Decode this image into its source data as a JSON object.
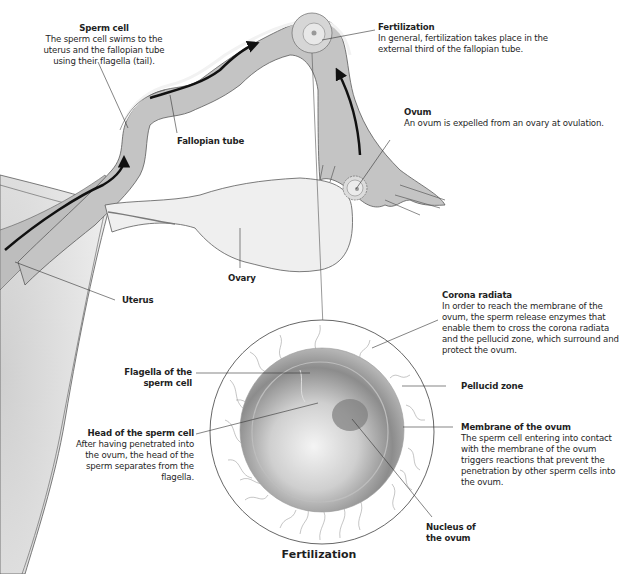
{
  "diagram": {
    "caption": "Fertilization",
    "labels": {
      "sperm_cell": {
        "title": "Sperm cell",
        "description": "The sperm cell swims to the uterus and the fallopian tube using their flagella (tail)."
      },
      "fertilization": {
        "title": "Fertilization",
        "description": "In general, fertilization takes place in the external third of the fallopian tube."
      },
      "ovum": {
        "title": "Ovum",
        "description": "An ovum is expelled from an ovary at ovulation."
      },
      "fallopian_tube": {
        "title": "Fallopian tube"
      },
      "ovary": {
        "title": "Ovary"
      },
      "uterus": {
        "title": "Uterus"
      },
      "corona_radiata": {
        "title": "Corona radiata",
        "description": "In order to reach the membrane of the ovum, the sperm release enzymes that enable them to cross the corona radiata and the pellucid zone, which surround and protect the ovum."
      },
      "pellucid_zone": {
        "title": "Pellucid zone"
      },
      "membrane_of_ovum": {
        "title": "Membrane of the ovum",
        "description": "The sperm cell entering into contact with the membrane of the ovum triggers reactions that prevent  the penetration by other sperm cells into the ovum."
      },
      "nucleus_of_ovum": {
        "title": "Nucleus of the ovum"
      },
      "flagella_of_sperm": {
        "title": "Flagella of the sperm cell"
      },
      "head_of_sperm": {
        "title": "Head of the sperm cell",
        "description": "After having penetrated into the ovum, the head of the sperm separates from the flagella."
      }
    },
    "colors": {
      "tube_fill": "#c4c4c4",
      "tube_wall": "#eeeeee",
      "outline": "#5a5a5a",
      "arrow": "#111111",
      "uterus_fill": "#d9d9d9",
      "ovary_fill": "#efefef",
      "ovum_dark": "#7d7d7d",
      "leader_line": "#333333"
    }
  }
}
